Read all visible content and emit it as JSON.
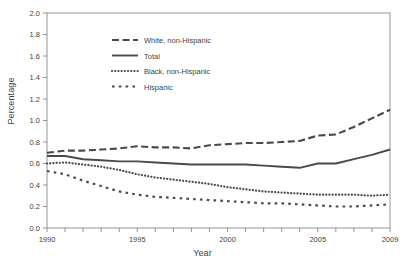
{
  "chart_data": {
    "type": "line",
    "title": "",
    "xlabel": "Year",
    "ylabel": "Percentage",
    "xlim": [
      1990,
      2009
    ],
    "ylim": [
      0.0,
      2.0
    ],
    "grid": false,
    "legend_position": "upper-left-inside",
    "x": [
      1990,
      1991,
      1992,
      1993,
      1994,
      1995,
      1996,
      1997,
      1998,
      1999,
      2000,
      2001,
      2002,
      2003,
      2004,
      2005,
      2006,
      2007,
      2008,
      2009
    ],
    "xticks": [
      1990,
      1991,
      1992,
      1993,
      1994,
      1995,
      1996,
      1997,
      1998,
      1999,
      2000,
      2001,
      2002,
      2003,
      2004,
      2005,
      2006,
      2007,
      2008,
      2009
    ],
    "xtick_labels": [
      "1990",
      "",
      "",
      "",
      "",
      "1995",
      "",
      "",
      "",
      "",
      "2000",
      "",
      "",
      "",
      "",
      "2005",
      "",
      "",
      "",
      "2009"
    ],
    "yticks": [
      0.0,
      0.2,
      0.4,
      0.6,
      0.8,
      1.0,
      1.2,
      1.4,
      1.6,
      1.8,
      2.0
    ],
    "ytick_labels": [
      "0.0",
      "0.2",
      "0.4",
      "0.6",
      "0.8",
      "1.0",
      "1.2",
      "1.4",
      "1.6",
      "1.8",
      "2.0"
    ],
    "series": [
      {
        "name": "White, non-Hispanic",
        "style": "dashed",
        "color": "#4a4a4a",
        "values": [
          0.7,
          0.72,
          0.72,
          0.73,
          0.74,
          0.76,
          0.75,
          0.75,
          0.74,
          0.77,
          0.78,
          0.79,
          0.79,
          0.8,
          0.81,
          0.86,
          0.87,
          0.94,
          1.02,
          1.1
        ]
      },
      {
        "name": "Total",
        "style": "solid",
        "color": "#4a4a4a",
        "values": [
          0.67,
          0.67,
          0.64,
          0.63,
          0.62,
          0.62,
          0.61,
          0.6,
          0.59,
          0.59,
          0.59,
          0.59,
          0.58,
          0.57,
          0.56,
          0.6,
          0.6,
          0.64,
          0.68,
          0.73
        ]
      },
      {
        "name": "Black, non-Hispanic",
        "style": "dotted",
        "color": "#4a4a4a",
        "values": [
          0.6,
          0.61,
          0.59,
          0.57,
          0.54,
          0.5,
          0.47,
          0.45,
          0.43,
          0.41,
          0.38,
          0.36,
          0.34,
          0.33,
          0.32,
          0.31,
          0.31,
          0.31,
          0.3,
          0.31
        ]
      },
      {
        "name": "Hispanic",
        "style": "dashdot",
        "color": "#4a4a4a",
        "values": [
          0.53,
          0.5,
          0.44,
          0.39,
          0.34,
          0.31,
          0.29,
          0.28,
          0.27,
          0.26,
          0.25,
          0.24,
          0.23,
          0.23,
          0.22,
          0.21,
          0.2,
          0.2,
          0.21,
          0.22
        ]
      }
    ]
  }
}
